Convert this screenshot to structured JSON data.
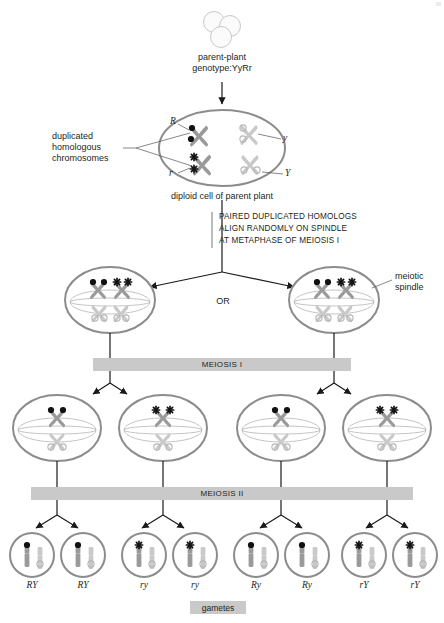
{
  "diagram": {
    "corner_mark": "III",
    "parent": {
      "seed_cluster_name": "pea-seed-cluster",
      "caption_line1": "parent-plant",
      "caption_line2": "genotype:YyRr"
    },
    "diploid_cell": {
      "caption": "diploid cell of parent plant",
      "pointer_label_line1": "duplicated",
      "pointer_label_line2": "homologous",
      "pointer_label_line3": "chromosomes",
      "alleles": {
        "top_left": "R",
        "top_right": "y",
        "bottom_left": "r",
        "bottom_right": "Y"
      }
    },
    "metaphase_note": {
      "line1": "PAIRED DUPLICATED HOMOLOGS",
      "line2": "ALIGN RANDOMLY ON SPINDLE",
      "line3": "AT METAPHASE OF MEIOSIS I"
    },
    "or_label": "OR",
    "spindle_label_line1": "meiotic",
    "spindle_label_line2": "spindle",
    "phase_bars": {
      "meiosis_1": "MEIOSIS I",
      "meiosis_2": "MEIOSIS II"
    },
    "gametes_caption": "gametes",
    "gamete_labels": [
      "RY",
      "RY",
      "ry",
      "ry",
      "Ry",
      "Ry",
      "rY",
      "rY"
    ],
    "colors": {
      "chromosome_gray": "#9a9a9a",
      "chromosome_light": "#c4c4c4",
      "centromere_dark": "#1a1a1a",
      "cell_outline": "#8c8c8c",
      "spindle_line": "#b0b0b0",
      "bar_gray": "#c9c9c9",
      "text": "#231f20"
    }
  }
}
